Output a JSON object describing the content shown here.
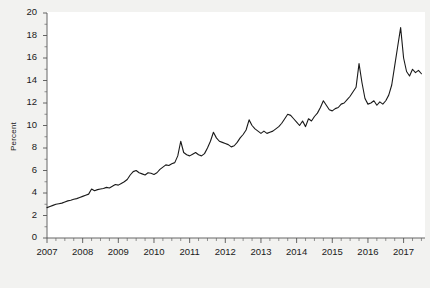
{
  "chart_data": {
    "type": "line",
    "title": "",
    "subtitle": "",
    "xlabel": "",
    "ylabel": "Percent",
    "xlim": [
      2007.0,
      2017.6
    ],
    "ylim": [
      0,
      20
    ],
    "ytick_labels": [
      "0",
      "2",
      "4",
      "6",
      "8",
      "10",
      "12",
      "14",
      "16",
      "18",
      "20"
    ],
    "ytick_values": [
      0,
      2,
      4,
      6,
      8,
      10,
      12,
      14,
      16,
      18,
      20
    ],
    "xtick_labels": [
      "2007",
      "2008",
      "2009",
      "2010",
      "2011",
      "2012",
      "2013",
      "2014",
      "2015",
      "2016",
      "2017"
    ],
    "xtick_values": [
      2007,
      2008,
      2009,
      2010,
      2011,
      2012,
      2013,
      2014,
      2015,
      2016,
      2017
    ],
    "x_minor_ticks_per_interval": 4,
    "grid": false,
    "legend": null,
    "line_color": "#1a1a1a",
    "line_width": 1.1,
    "plot_bg": "#ffffff",
    "figure_bg": "#f2f2f0",
    "series": [
      {
        "name": "Percent",
        "x": [
          2007.0,
          2007.083,
          2007.167,
          2007.25,
          2007.333,
          2007.417,
          2007.5,
          2007.583,
          2007.667,
          2007.75,
          2007.833,
          2007.917,
          2008.0,
          2008.083,
          2008.167,
          2008.25,
          2008.333,
          2008.417,
          2008.5,
          2008.583,
          2008.667,
          2008.75,
          2008.833,
          2008.917,
          2009.0,
          2009.083,
          2009.167,
          2009.25,
          2009.333,
          2009.417,
          2009.5,
          2009.583,
          2009.667,
          2009.75,
          2009.833,
          2009.917,
          2010.0,
          2010.083,
          2010.167,
          2010.25,
          2010.333,
          2010.417,
          2010.5,
          2010.583,
          2010.667,
          2010.75,
          2010.833,
          2010.917,
          2011.0,
          2011.083,
          2011.167,
          2011.25,
          2011.333,
          2011.417,
          2011.5,
          2011.583,
          2011.667,
          2011.75,
          2011.833,
          2011.917,
          2012.0,
          2012.083,
          2012.167,
          2012.25,
          2012.333,
          2012.417,
          2012.5,
          2012.583,
          2012.667,
          2012.75,
          2012.833,
          2012.917,
          2013.0,
          2013.083,
          2013.167,
          2013.25,
          2013.333,
          2013.417,
          2013.5,
          2013.583,
          2013.667,
          2013.75,
          2013.833,
          2013.917,
          2014.0,
          2014.083,
          2014.167,
          2014.25,
          2014.333,
          2014.417,
          2014.5,
          2014.583,
          2014.667,
          2014.75,
          2014.833,
          2014.917,
          2015.0,
          2015.083,
          2015.167,
          2015.25,
          2015.333,
          2015.417,
          2015.5,
          2015.583,
          2015.667,
          2015.75,
          2015.833,
          2015.917,
          2016.0,
          2016.083,
          2016.167,
          2016.25,
          2016.333,
          2016.417,
          2016.5,
          2016.583,
          2016.667,
          2016.75,
          2016.833,
          2016.917,
          2017.0,
          2017.083,
          2017.167,
          2017.25,
          2017.333,
          2017.417,
          2017.5
        ],
        "y": [
          2.7,
          2.8,
          2.9,
          3.0,
          3.05,
          3.1,
          3.2,
          3.3,
          3.35,
          3.45,
          3.5,
          3.6,
          3.7,
          3.8,
          3.9,
          4.35,
          4.2,
          4.3,
          4.35,
          4.4,
          4.5,
          4.45,
          4.6,
          4.75,
          4.7,
          4.85,
          5.0,
          5.2,
          5.6,
          5.9,
          6.0,
          5.8,
          5.7,
          5.6,
          5.8,
          5.75,
          5.65,
          5.8,
          6.1,
          6.3,
          6.5,
          6.45,
          6.6,
          6.7,
          7.3,
          8.6,
          7.6,
          7.4,
          7.3,
          7.45,
          7.6,
          7.4,
          7.3,
          7.5,
          8.0,
          8.6,
          9.4,
          8.9,
          8.6,
          8.5,
          8.4,
          8.3,
          8.1,
          8.2,
          8.5,
          8.9,
          9.2,
          9.6,
          10.5,
          10.0,
          9.7,
          9.5,
          9.3,
          9.5,
          9.3,
          9.4,
          9.5,
          9.7,
          9.9,
          10.2,
          10.6,
          11.0,
          10.9,
          10.6,
          10.3,
          10.0,
          10.4,
          9.9,
          10.6,
          10.4,
          10.8,
          11.1,
          11.6,
          12.2,
          11.8,
          11.4,
          11.3,
          11.5,
          11.6,
          11.9,
          12.0,
          12.3,
          12.6,
          13.0,
          13.4,
          15.5,
          13.8,
          12.4,
          11.9,
          12.0,
          12.2,
          11.8,
          12.1,
          11.9,
          12.2,
          12.7,
          13.6,
          15.3,
          17.0,
          18.7,
          16.0,
          14.8,
          14.4,
          15.0,
          14.7,
          14.9,
          14.6
        ]
      }
    ]
  },
  "figure": {
    "plot_left_px": 47,
    "plot_right_px": 425,
    "plot_top_px": 13,
    "plot_bottom_px": 238
  }
}
